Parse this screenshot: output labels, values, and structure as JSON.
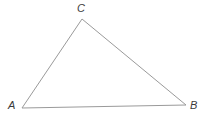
{
  "figure": {
    "kind": "geometry-diagram",
    "shape": "triangle",
    "background_color": "#ffffff",
    "width": 206,
    "height": 124,
    "stroke_color": "#9a9a9a",
    "stroke_width": 1,
    "label_color": "#3b3b3b",
    "label_font_size": 11,
    "label_style": "italic"
  },
  "vertices": [
    {
      "id": "A",
      "label": "A",
      "x": 22,
      "y": 108,
      "label_x": 8,
      "label_y": 100
    },
    {
      "id": "B",
      "label": "B",
      "x": 186,
      "y": 105,
      "label_x": 190,
      "label_y": 100
    },
    {
      "id": "C",
      "label": "C",
      "x": 82,
      "y": 19,
      "label_x": 77,
      "label_y": 3
    }
  ],
  "edges": [
    {
      "id": "AC",
      "from": "A",
      "to": "C"
    },
    {
      "id": "CB",
      "from": "C",
      "to": "B"
    },
    {
      "id": "AB",
      "from": "A",
      "to": "B"
    }
  ],
  "polygon_points": "22,108 82,19 186,105"
}
